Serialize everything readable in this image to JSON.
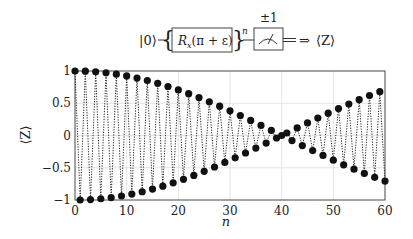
{
  "circuit": {
    "input_state": "|0⟩",
    "gate_label_main": "R",
    "gate_label_sub": "x",
    "gate_label_arg": "(π + ε)",
    "repeat_exponent": "n",
    "measurement_outcome": "±1",
    "output_arrow": "⇒",
    "output_label": "⟨Z⟩"
  },
  "chart_data": {
    "type": "line",
    "title": "",
    "xlabel": "n",
    "ylabel": "⟨Z⟩",
    "xlim": [
      0,
      60
    ],
    "ylim": [
      -1,
      1
    ],
    "xticks": [
      0,
      10,
      20,
      30,
      40,
      50,
      60
    ],
    "xtick_labels": [
      "0",
      "10",
      "20",
      "30",
      "40",
      "50",
      "60"
    ],
    "yticks": [
      1,
      0.5,
      0,
      -0.5,
      -1
    ],
    "ytick_labels": [
      "1",
      "0.5",
      "0",
      "−0.5",
      "−1"
    ],
    "grid": true,
    "legend": null,
    "line_style": "dotted",
    "marker": "filled-circle",
    "model": "⟨Z⟩ = (−1)^n cos(nε), ε ≈ π/80",
    "series": [
      {
        "name": "⟨Z⟩",
        "x": [
          0,
          1,
          2,
          3,
          4,
          5,
          6,
          7,
          8,
          9,
          10,
          11,
          12,
          13,
          14,
          15,
          16,
          17,
          18,
          19,
          20,
          21,
          22,
          23,
          24,
          25,
          26,
          27,
          28,
          29,
          30,
          31,
          32,
          33,
          34,
          35,
          36,
          37,
          38,
          39,
          40,
          41,
          42,
          43,
          44,
          45,
          46,
          47,
          48,
          49,
          50,
          51,
          52,
          53,
          54,
          55,
          56,
          57,
          58,
          59,
          60
        ],
        "values": [
          1.0,
          -1.0,
          0.997,
          -0.993,
          0.988,
          -0.981,
          0.972,
          -0.962,
          0.951,
          -0.938,
          0.924,
          -0.908,
          0.891,
          -0.872,
          0.853,
          -0.831,
          0.809,
          -0.786,
          0.76,
          -0.734,
          0.707,
          -0.679,
          0.649,
          -0.619,
          0.588,
          -0.556,
          0.522,
          -0.488,
          0.454,
          -0.418,
          0.383,
          -0.346,
          0.309,
          -0.271,
          0.233,
          -0.195,
          0.156,
          -0.118,
          0.078,
          -0.039,
          0.0,
          0.039,
          -0.078,
          0.118,
          -0.156,
          0.195,
          -0.233,
          0.271,
          -0.309,
          0.346,
          -0.383,
          0.418,
          -0.454,
          0.488,
          -0.522,
          0.556,
          -0.588,
          0.619,
          -0.649,
          0.679,
          -0.707
        ]
      }
    ]
  }
}
